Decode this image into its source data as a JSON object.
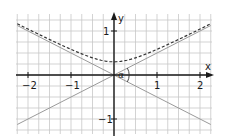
{
  "chart_data": {
    "type": "line",
    "title": "",
    "xlabel": "x",
    "ylabel": "y",
    "xlim": [
      -2.25,
      2.25
    ],
    "ylim": [
      -1.35,
      1.4
    ],
    "grid": true,
    "grid_step": 0.25,
    "x_ticks": [
      -2,
      -1,
      1,
      2
    ],
    "x_tick_labels": [
      "−2",
      "−1",
      "1",
      "2"
    ],
    "y_ticks": [
      1,
      -1
    ],
    "y_tick_labels": [
      "1",
      "−1"
    ],
    "series": [
      {
        "name": "asymptote y = x/2",
        "style": "solid gray",
        "x": [
          -2.25,
          2.25
        ],
        "y": [
          -1.125,
          1.125
        ]
      },
      {
        "name": "asymptote y = -x/2",
        "style": "solid gray",
        "x": [
          -2.25,
          2.25
        ],
        "y": [
          1.125,
          -1.125
        ]
      },
      {
        "name": "hyperbola branch y = sqrt(0.09 + x^2/4)",
        "style": "dashed",
        "x": [
          -2.25,
          -2,
          -1.5,
          -1,
          -0.5,
          0,
          0.5,
          1,
          1.5,
          2,
          2.25
        ],
        "y": [
          1.16,
          1.04,
          0.81,
          0.58,
          0.39,
          0.3,
          0.39,
          0.58,
          0.81,
          1.04,
          1.16
        ]
      }
    ],
    "annotations": [
      {
        "text": "α",
        "at": [
          0.25,
          -0.05
        ],
        "meaning": "angle between asymptotes"
      }
    ]
  },
  "labels": {
    "x_axis": "x",
    "y_axis": "y",
    "x_neg2": "−2",
    "x_neg1": "−1",
    "x_pos1": "1",
    "x_pos2": "2",
    "y_pos1": "1",
    "y_neg1": "−1",
    "angle": "α"
  }
}
